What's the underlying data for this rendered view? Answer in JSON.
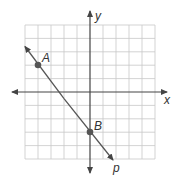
{
  "graph": {
    "x_axis_label": "x",
    "y_axis_label": "y",
    "line_label": "p",
    "grid": {
      "columns": 10,
      "rows": 10,
      "x_range": [
        -5,
        5
      ],
      "y_range": [
        -5,
        5
      ]
    },
    "points": [
      {
        "label": "A",
        "x": -4,
        "y": 2
      },
      {
        "label": "B",
        "x": 0,
        "y": -3
      }
    ],
    "colors": {
      "grid": "#c8c8c8",
      "axis": "#444444",
      "line": "#555555",
      "point": "#555555"
    }
  }
}
